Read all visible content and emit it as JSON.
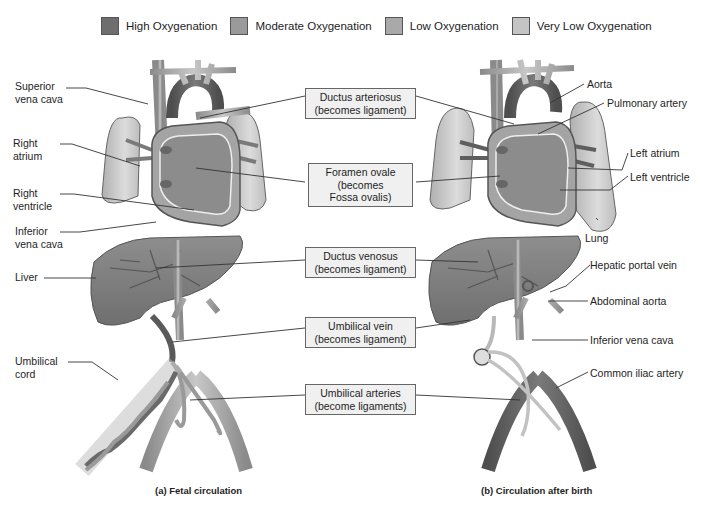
{
  "legend": {
    "items": [
      {
        "label": "High Oxygenation",
        "color": "#6e6e6e"
      },
      {
        "label": "Moderate Oxygenation",
        "color": "#9a9a9a"
      },
      {
        "label": "Low Oxygenation",
        "color": "#a9a9a9"
      },
      {
        "label": "Very Low Oxygenation",
        "color": "#c4c4c4"
      }
    ]
  },
  "left_labels": {
    "superior_vena_cava": [
      "Superior",
      "vena cava"
    ],
    "right_atrium": [
      "Right",
      "atrium"
    ],
    "right_ventricle": [
      "Right",
      "ventricle"
    ],
    "inferior_vena_cava": [
      "Inferior",
      "vena cava"
    ],
    "liver": "Liver",
    "umbilical_cord": [
      "Umbilical",
      "cord"
    ]
  },
  "center_boxes": [
    {
      "line1": "Ductus arteriosus",
      "line2": "(becomes ligament)"
    },
    {
      "line1": "Foramen ovale",
      "line2": "(becomes",
      "line3": "Fossa ovalis)"
    },
    {
      "line1": "Ductus venosus",
      "line2": "(becomes ligament)"
    },
    {
      "line1": "Umbilical vein",
      "line2": "(becomes ligament)"
    },
    {
      "line1": "Umbilical arteries",
      "line2": "(become ligaments)"
    }
  ],
  "right_labels": {
    "aorta": "Aorta",
    "pulmonary_artery": "Pulmonary artery",
    "left_atrium": "Left atrium",
    "left_ventricle": "Left ventricle",
    "lung": "Lung",
    "hepatic_portal_vein": "Hepatic portal vein",
    "abdominal_aorta": "Abdominal aorta",
    "inferior_vena_cava": "Inferior vena cava",
    "common_iliac_artery": "Common iliac artery"
  },
  "captions": {
    "a": "(a)  Fetal circulation",
    "b": "(b)  Circulation after birth"
  }
}
